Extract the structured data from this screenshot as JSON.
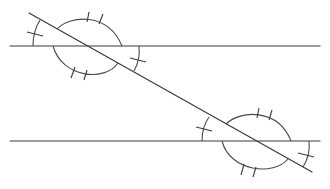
{
  "diagram": {
    "stroke_color": "#3a3a3a",
    "background": "#ffffff",
    "lines": {
      "parallel_top": {
        "x1": 10,
        "y1": 46,
        "x2": 320,
        "y2": 46
      },
      "parallel_bottom": {
        "x1": 10,
        "y1": 141,
        "x2": 320,
        "y2": 141
      },
      "transversal": {
        "x1": 29,
        "y1": 13,
        "x2": 312,
        "y2": 172
      }
    },
    "intersections": [
      {
        "name": "upper",
        "x": 87,
        "y": 46
      },
      {
        "name": "lower",
        "x": 256,
        "y": 141
      }
    ],
    "angle_marks": {
      "obtuse_angles": {
        "tick_count": 2,
        "arc": "large"
      },
      "acute_angles": {
        "tick_count": 1,
        "arc": "small"
      }
    }
  }
}
